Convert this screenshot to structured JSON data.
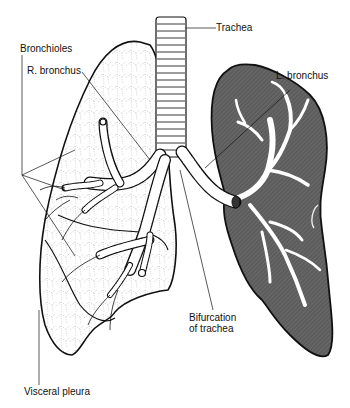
{
  "diagram": {
    "labels": {
      "trachea": "Trachea",
      "bronchioles": "Bronchioles",
      "r_bronchus": "R. bronchus",
      "l_bronchus": "L. bronchus",
      "bifurcation_line1": "Bifurcation",
      "bifurcation_line2": "of trachea",
      "visceral_pleura": "Visceral pleura"
    },
    "colors": {
      "background": "#ffffff",
      "outline": "#111111",
      "left_lung_fill": "#5a5a5a",
      "airway_fill": "#ffffff",
      "pleura_dots": "#9a9a9a"
    }
  }
}
